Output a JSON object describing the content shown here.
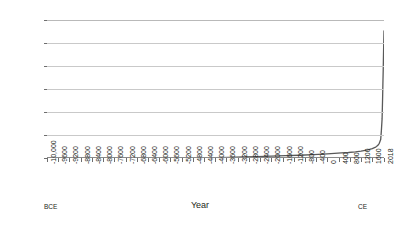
{
  "chart_data": {
    "type": "line",
    "title": "",
    "xlabel": "Year",
    "ylabel": "Urbanization rate (%)",
    "xlim": [
      -10000,
      2018
    ],
    "ylim": [
      0,
      60
    ],
    "grid": true,
    "legend": null,
    "line_color": "#595959",
    "grid_color": "#c9c9c9",
    "axis_color": "#6e6e6e",
    "background": "#ffffff",
    "y_ticks": [
      0,
      10,
      20,
      30,
      40,
      50,
      60
    ],
    "x_tick_labels": [
      "-10,000",
      "-9600",
      "-9200",
      "-8800",
      "-8400",
      "-8000",
      "-7600",
      "-7200",
      "-6800",
      "-6400",
      "-6000",
      "-5600",
      "-5200",
      "-4800",
      "-4400",
      "-4000",
      "-3600",
      "-3200",
      "-2800",
      "-2400",
      "-2000",
      "-1600",
      "-1200",
      "-800",
      "-400",
      "0",
      "400",
      "800",
      "1200",
      "1600",
      "2018"
    ],
    "x_tick_values": [
      -10000,
      -9600,
      -9200,
      -8800,
      -8400,
      -8000,
      -7600,
      -7200,
      -6800,
      -6400,
      -6000,
      -5600,
      -5200,
      -4800,
      -4400,
      -4000,
      -3600,
      -3200,
      -2800,
      -2400,
      -2000,
      -1600,
      -1200,
      -800,
      -400,
      0,
      400,
      800,
      1200,
      1600,
      2018
    ],
    "era_left_label": "BCE",
    "era_right_label": "CE",
    "x": [
      -10000,
      -9000,
      -8000,
      -7000,
      -6000,
      -5000,
      -4000,
      -3500,
      -3000,
      -2500,
      -2000,
      -1500,
      -1000,
      -500,
      0,
      250,
      500,
      750,
      1000,
      1200,
      1400,
      1500,
      1600,
      1700,
      1750,
      1800,
      1850,
      1900,
      1925,
      1950,
      1960,
      1970,
      1980,
      1990,
      2000,
      2010,
      2018
    ],
    "y": [
      0.0,
      0.0,
      0.0,
      0.0,
      0.05,
      0.1,
      0.2,
      0.3,
      0.45,
      0.6,
      0.8,
      1.0,
      1.2,
      1.5,
      1.8,
      2.0,
      2.2,
      2.4,
      2.7,
      3.0,
      3.4,
      3.7,
      4.1,
      4.6,
      5.0,
      5.5,
      6.4,
      8.0,
      12.0,
      17.0,
      22.0,
      27.0,
      33.0,
      38.0,
      45.0,
      51.0,
      55.3
    ],
    "peak_value": 55.3,
    "peak_year": 2018
  }
}
